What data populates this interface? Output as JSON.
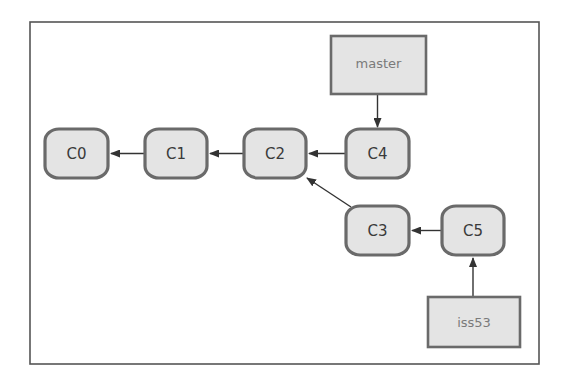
{
  "diagram": {
    "type": "git-branch-graph",
    "colors": {
      "frame_border": "#555555",
      "node_fill": "#e4e4e4",
      "node_border": "#6a6a6a",
      "node_text": "#3a3a3a",
      "branch_text": "#7a7a7a",
      "edge": "#333333"
    },
    "commits": [
      {
        "id": "C0",
        "label": "C0",
        "x": 44,
        "y": 128,
        "w": 65,
        "h": 51
      },
      {
        "id": "C1",
        "label": "C1",
        "x": 144,
        "y": 128,
        "w": 64,
        "h": 51
      },
      {
        "id": "C2",
        "label": "C2",
        "x": 243,
        "y": 128,
        "w": 64,
        "h": 51
      },
      {
        "id": "C4",
        "label": "C4",
        "x": 345,
        "y": 128,
        "w": 65,
        "h": 51
      },
      {
        "id": "C3",
        "label": "C3",
        "x": 345,
        "y": 205,
        "w": 65,
        "h": 51
      },
      {
        "id": "C5",
        "label": "C5",
        "x": 441,
        "y": 205,
        "w": 64,
        "h": 51
      }
    ],
    "branches": [
      {
        "id": "master",
        "label": "master",
        "x": 331,
        "y": 36,
        "w": 95,
        "h": 58,
        "points_to": "C4"
      },
      {
        "id": "iss53",
        "label": "iss53",
        "x": 428,
        "y": 297,
        "w": 92,
        "h": 50,
        "points_to": "C5"
      }
    ],
    "edges": [
      {
        "from": "C1",
        "to": "C0"
      },
      {
        "from": "C2",
        "to": "C1"
      },
      {
        "from": "C4",
        "to": "C2"
      },
      {
        "from": "C3",
        "to": "C2"
      },
      {
        "from": "C5",
        "to": "C3"
      },
      {
        "from": "master",
        "to": "C4"
      },
      {
        "from": "iss53",
        "to": "C5"
      }
    ]
  }
}
